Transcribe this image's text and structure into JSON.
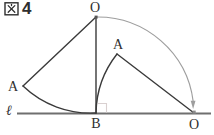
{
  "figure_label": {
    "full": "図4",
    "kanji": "図",
    "number": "4"
  },
  "baseline": {
    "label": "ℓ"
  },
  "points": {
    "o_top": "O",
    "a_left": "A",
    "a_rotated": "A",
    "b": "B",
    "o_rotated": "O"
  },
  "colors": {
    "stroke_dark": "#3a3a3a",
    "baseline": "#6f6f6f",
    "rotation_arc": "#9e9e9e",
    "right_angle_mark": "#d9d0d0",
    "vertex_dot_dark": "#555555",
    "vertex_dot_gray": "#8a8a8a",
    "text": "#2f2f2f",
    "background": "#ffffff"
  }
}
